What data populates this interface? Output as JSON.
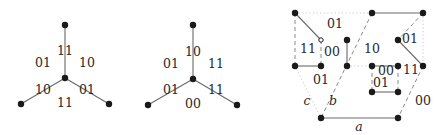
{
  "figures": [
    {
      "name": "star-graph-1",
      "edge_labels": {
        "top": "11",
        "left": "10",
        "right": "01"
      },
      "face_labels": {
        "upper_left": "01",
        "upper_right": "10",
        "bottom": "11"
      }
    },
    {
      "name": "star-graph-2",
      "edge_labels": {
        "top": "10",
        "left": "01",
        "right": "11"
      },
      "face_labels": {
        "upper_left": "01",
        "upper_right": "11",
        "bottom": "00"
      }
    },
    {
      "name": "cube-decomposition",
      "region_labels": [
        "01",
        "11",
        "00",
        "01",
        "10",
        "01",
        "00",
        "11",
        "01",
        "00"
      ],
      "axis_labels": {
        "a": "a",
        "b": "b",
        "c": "c"
      }
    }
  ],
  "colors": {
    "node": "#1a1a1a",
    "edge": "#6a6a6a",
    "dashed_edge": "#8a8a8a",
    "dotted_edge": "#c8c8c8",
    "text": "#2a2a2a"
  }
}
